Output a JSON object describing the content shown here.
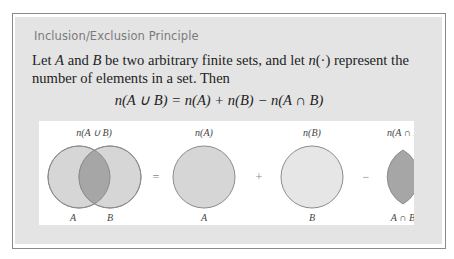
{
  "box": {
    "title": "Inclusion/Exclusion Principle",
    "paragraph": {
      "p1": "Let ",
      "A": "A",
      "p2": " and ",
      "B": "B",
      "p3": " be two arbitrary finite sets, and let ",
      "n": "n",
      "p4": "(·) represent the number of elements in a set. Then"
    },
    "formula": "n(A ∪ B) = n(A) + n(B) − n(A ∩ B)"
  },
  "diagram": {
    "union": {
      "top_label": "n(A ∪ B)",
      "left_label": "A",
      "right_label": "B"
    },
    "equals": "=",
    "set_a": {
      "top_label": "n(A)",
      "bottom_label": "A"
    },
    "plus": "+",
    "set_b": {
      "top_label": "n(B)",
      "bottom_label": "B"
    },
    "minus": "−",
    "intersection": {
      "top_label": "n(A ∩ B)",
      "bottom_label": "A ∩ B"
    },
    "colors": {
      "set_fill": "#d6d6d6",
      "set_b_fill": "#e6e6e6",
      "intersection_fill": "#a6a6a6",
      "stroke": "#8c8c8c"
    }
  }
}
